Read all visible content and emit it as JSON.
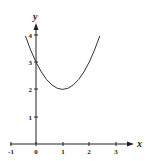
{
  "chart_data": {
    "type": "line",
    "title": "",
    "xlabel": "x",
    "ylabel": "y",
    "xlim": [
      -1,
      3.4
    ],
    "ylim": [
      0,
      4.4
    ],
    "x_ticks": [
      "-1",
      "0",
      "1",
      "2",
      "3"
    ],
    "y_ticks": [
      "1",
      "2",
      "3",
      "4"
    ],
    "grid": false,
    "legend": null,
    "series": [
      {
        "name": "y = (x - 1)^2 + 2",
        "x": [
          -0.4,
          -0.2,
          0,
          0.2,
          0.4,
          0.6,
          0.8,
          1.0,
          1.2,
          1.4,
          1.6,
          1.8,
          2.0,
          2.2,
          2.4
        ],
        "values": [
          3.96,
          3.44,
          3.0,
          2.64,
          2.36,
          2.16,
          2.04,
          2.0,
          2.04,
          2.16,
          2.36,
          2.64,
          3.0,
          3.44,
          3.96
        ]
      }
    ],
    "annotations": [
      "vertex at (1, 2)",
      "y-intercept at (0, 3)"
    ]
  },
  "labels": {
    "x_axis": "x",
    "y_axis": "y",
    "x_ticks": [
      "-1",
      "0",
      "1",
      "2",
      "3"
    ],
    "y_ticks": [
      "1",
      "2",
      "3",
      "4"
    ]
  }
}
